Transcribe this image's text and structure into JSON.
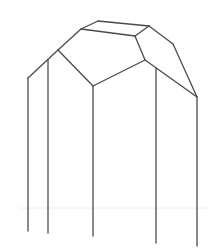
{
  "diagram": {
    "type": "crystal-wireframe",
    "stroke_color": "#4a4a4a",
    "background": "#ffffff",
    "vertices": {
      "A": [
        28,
        78
      ],
      "B": [
        48,
        60
      ],
      "C": [
        58,
        50
      ],
      "D": [
        81,
        29
      ],
      "E": [
        98,
        21
      ],
      "F": [
        149,
        26
      ],
      "G": [
        135,
        36
      ],
      "H": [
        173,
        44
      ],
      "I": [
        197,
        97
      ],
      "J": [
        145,
        60
      ],
      "K": [
        93,
        86
      ],
      "L": [
        156,
        68
      ]
    },
    "edges": [
      [
        "A",
        "C"
      ],
      [
        "C",
        "D"
      ],
      [
        "D",
        "E"
      ],
      [
        "E",
        "F"
      ],
      [
        "F",
        "H"
      ],
      [
        "H",
        "I"
      ],
      [
        "D",
        "G"
      ],
      [
        "G",
        "F"
      ],
      [
        "G",
        "J"
      ],
      [
        "C",
        "K"
      ],
      [
        "K",
        "J"
      ],
      [
        "J",
        "I"
      ]
    ],
    "verticals": [
      {
        "x": 28,
        "y1": 78,
        "y2": 231
      },
      {
        "x": 48,
        "y1": 60,
        "y2": 233
      },
      {
        "x": 93,
        "y1": 86,
        "y2": 236
      },
      {
        "x": 156,
        "y1": 68,
        "y2": 243
      },
      {
        "x": 197,
        "y1": 97,
        "y2": 246
      }
    ],
    "faint_line": {
      "y": 208,
      "x1": 20,
      "x2": 210
    }
  }
}
